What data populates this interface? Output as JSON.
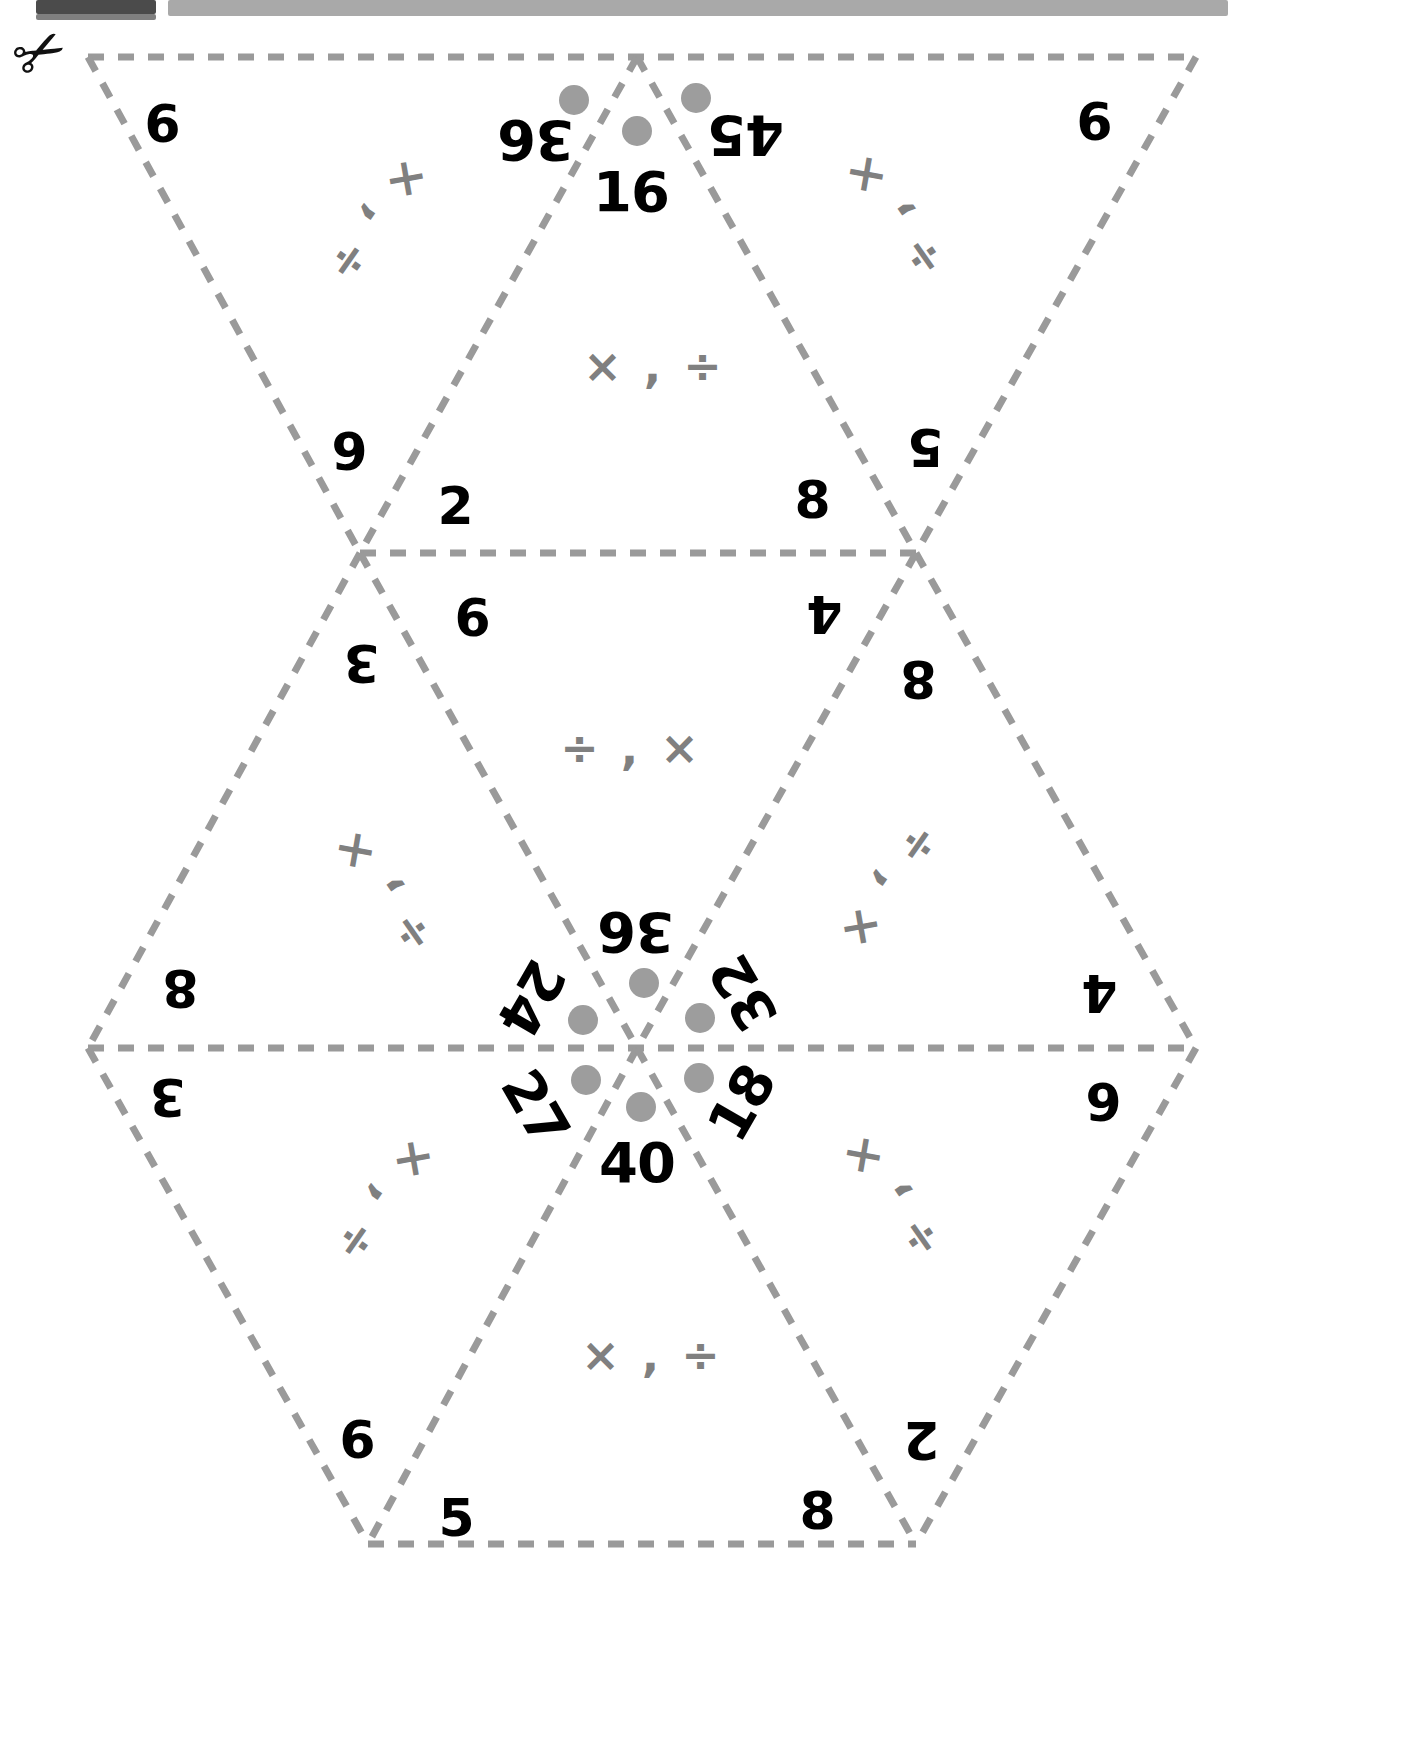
{
  "page": {
    "kind": "cut-out-hexagon-math-puzzle-worksheet",
    "cut_hint_icon": "scissors-icon",
    "line_color": "#9a9a9a",
    "number_color": "#000000",
    "operator_color": "#808080",
    "dot_color": "#9d9d9d"
  },
  "operators": {
    "times_divide": "× , ÷",
    "divide_times": "÷ , ×"
  },
  "center_numbers": [
    {
      "id": "c-16",
      "value": "16",
      "rotation": 0,
      "x": 631,
      "y": 192
    },
    {
      "id": "c-36",
      "value": "36",
      "rotation": 180,
      "x": 536,
      "y": 140
    },
    {
      "id": "c-45",
      "value": "45",
      "rotation": 180,
      "x": 746,
      "y": 135
    },
    {
      "id": "c-40",
      "value": "40",
      "rotation": 0,
      "x": 637,
      "y": 1163
    },
    {
      "id": "c-24",
      "value": "24",
      "rotation": 120,
      "x": 531,
      "y": 998
    },
    {
      "id": "c-36b",
      "value": "36",
      "rotation": 180,
      "x": 636,
      "y": 932
    },
    {
      "id": "c-32",
      "value": "32",
      "rotation": 240,
      "x": 744,
      "y": 993
    },
    {
      "id": "c-27",
      "value": "27",
      "rotation": 60,
      "x": 535,
      "y": 1108
    },
    {
      "id": "c-18",
      "value": "18",
      "rotation": 300,
      "x": 742,
      "y": 1103
    }
  ],
  "edge_numbers": [
    {
      "id": "e-9-tl",
      "value": "9",
      "rotation": 180,
      "x": 163,
      "y": 122
    },
    {
      "id": "e-9-tr",
      "value": "9",
      "rotation": 180,
      "x": 1095,
      "y": 120
    },
    {
      "id": "e-6-ml",
      "value": "6",
      "rotation": 180,
      "x": 350,
      "y": 450
    },
    {
      "id": "e-2",
      "value": "2",
      "rotation": 0,
      "x": 455,
      "y": 506
    },
    {
      "id": "e-8-mr",
      "value": "8",
      "rotation": 0,
      "x": 812,
      "y": 500
    },
    {
      "id": "e-5-mr",
      "value": "5",
      "rotation": 180,
      "x": 926,
      "y": 447
    },
    {
      "id": "e-6-mid",
      "value": "6",
      "rotation": 0,
      "x": 472,
      "y": 618
    },
    {
      "id": "e-4-mid",
      "value": "4",
      "rotation": 180,
      "x": 825,
      "y": 614
    },
    {
      "id": "e-3-ml",
      "value": "3",
      "rotation": 180,
      "x": 362,
      "y": 663
    },
    {
      "id": "e-8-mr2",
      "value": "8",
      "rotation": 180,
      "x": 919,
      "y": 679
    },
    {
      "id": "e-8-bl",
      "value": "8",
      "rotation": 180,
      "x": 181,
      "y": 988
    },
    {
      "id": "e-4-br",
      "value": "4",
      "rotation": 180,
      "x": 1100,
      "y": 993
    },
    {
      "id": "e-3-bl",
      "value": "3",
      "rotation": 180,
      "x": 168,
      "y": 1097
    },
    {
      "id": "e-6-br",
      "value": "6",
      "rotation": 180,
      "x": 1104,
      "y": 1101
    },
    {
      "id": "e-9-bl",
      "value": "9",
      "rotation": 180,
      "x": 358,
      "y": 1438
    },
    {
      "id": "e-5-b",
      "value": "5",
      "rotation": 0,
      "x": 456,
      "y": 1518
    },
    {
      "id": "e-8-b",
      "value": "8",
      "rotation": 0,
      "x": 817,
      "y": 1511
    },
    {
      "id": "e-2-br",
      "value": "2",
      "rotation": 180,
      "x": 922,
      "y": 1440
    }
  ],
  "operator_labels": [
    {
      "id": "op-tl",
      "text": "× , ÷",
      "rotation": 125,
      "x": 378,
      "y": 222
    },
    {
      "id": "op-tr",
      "text": "÷ , ×",
      "rotation": 235,
      "x": 893,
      "y": 215
    },
    {
      "id": "op-top",
      "text": "× , ÷",
      "rotation": 0,
      "x": 654,
      "y": 366
    },
    {
      "id": "op-mid",
      "text": "÷ , ×",
      "rotation": 0,
      "x": 631,
      "y": 748
    },
    {
      "id": "op-ml",
      "text": "÷ , ×",
      "rotation": 235,
      "x": 382,
      "y": 891
    },
    {
      "id": "op-mr",
      "text": "÷ , ×",
      "rotation": 125,
      "x": 890,
      "y": 888
    },
    {
      "id": "op-bl",
      "text": "× , ÷",
      "rotation": 125,
      "x": 385,
      "y": 1202
    },
    {
      "id": "op-br",
      "text": "÷ , ×",
      "rotation": 235,
      "x": 890,
      "y": 1196
    },
    {
      "id": "op-bottom",
      "text": "× , ÷",
      "rotation": 0,
      "x": 652,
      "y": 1355
    }
  ],
  "dots": [
    {
      "id": "d-36",
      "x": 574,
      "y": 100
    },
    {
      "id": "d-16",
      "x": 637,
      "y": 131
    },
    {
      "id": "d-45",
      "x": 696,
      "y": 98
    },
    {
      "id": "d-36b",
      "x": 644,
      "y": 983
    },
    {
      "id": "d-24",
      "x": 583,
      "y": 1020
    },
    {
      "id": "d-32",
      "x": 700,
      "y": 1018
    },
    {
      "id": "d-27",
      "x": 586,
      "y": 1080
    },
    {
      "id": "d-40",
      "x": 641,
      "y": 1107
    },
    {
      "id": "d-18",
      "x": 699,
      "y": 1078
    }
  ]
}
